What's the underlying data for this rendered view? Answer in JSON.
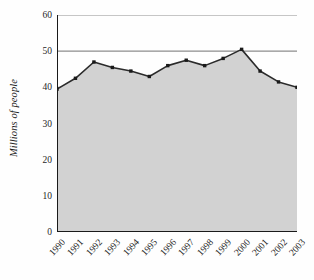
{
  "chart_data": {
    "type": "area",
    "title": "",
    "subtitle": "",
    "xlabel": "",
    "ylabel": "Millions of people",
    "categories": [
      "1990",
      "1991",
      "1992",
      "1993",
      "1994",
      "1995",
      "1996",
      "1997",
      "1998",
      "1999",
      "2000",
      "2001",
      "2002",
      "2003"
    ],
    "values": [
      39.5,
      42.5,
      47.0,
      45.5,
      44.5,
      43.0,
      46.0,
      47.5,
      46.0,
      48.0,
      50.5,
      44.5,
      41.5,
      40.0
    ],
    "series": [
      {
        "name": "Millions of people",
        "values": [
          39.5,
          42.5,
          47.0,
          45.5,
          44.5,
          43.0,
          46.0,
          47.5,
          46.0,
          48.0,
          50.5,
          44.5,
          41.5,
          40.0
        ]
      }
    ],
    "ylim": [
      0,
      60
    ],
    "ytick_values": [
      0,
      10,
      20,
      30,
      40,
      50,
      60
    ],
    "ytick_labels": [
      "0",
      "10",
      "20",
      "30",
      "40",
      "50",
      "60"
    ],
    "xtick_labels": [
      "1990",
      "1991",
      "1992",
      "1993",
      "1994",
      "1995",
      "1996",
      "1997",
      "1998",
      "1999",
      "2000",
      "2001",
      "2002",
      "2003"
    ],
    "grid": "horizontal",
    "legend": "none",
    "marker": "square",
    "annotations": [],
    "colors": {
      "line": "#2b2b2b",
      "marker": "#1a1a1a",
      "area_fill": "#d2d2d2",
      "gridline": "#8d8d8d",
      "axis": "#1a1a1a",
      "text": "#1f1f1f",
      "background": "#fefefe"
    }
  },
  "axes": {
    "y_title": "Millions of people",
    "y_ticks": [
      "60",
      "50",
      "40",
      "30",
      "20",
      "10",
      "0"
    ],
    "x_ticks": [
      "1990",
      "1991",
      "1992",
      "1993",
      "1994",
      "1995",
      "1996",
      "1997",
      "1998",
      "1999",
      "2000",
      "2001",
      "2002",
      "2003"
    ]
  }
}
